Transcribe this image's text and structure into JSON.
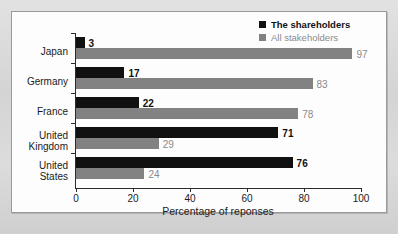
{
  "chart_data": {
    "type": "bar",
    "orientation": "horizontal",
    "title": "",
    "xlabel": "Percentage of reponses",
    "ylabel": "",
    "xlim": [
      0,
      100
    ],
    "xticks": [
      0,
      20,
      40,
      60,
      80,
      100
    ],
    "grid": false,
    "legend_position": "top-right",
    "categories": [
      "Japan",
      "Germany",
      "France",
      "United\nKingdom",
      "United\nStates"
    ],
    "series": [
      {
        "name": "The shareholders",
        "color": "#111111",
        "values": [
          3,
          17,
          22,
          71,
          76
        ]
      },
      {
        "name": "All stakeholders",
        "color": "#828282",
        "values": [
          97,
          83,
          78,
          29,
          24
        ]
      }
    ],
    "value_labels": {
      "shareholders": [
        "3",
        "17",
        "22",
        "71",
        "76"
      ],
      "stakeholders": [
        "97",
        "83",
        "78",
        "29",
        "24"
      ]
    }
  },
  "legend": {
    "entries": [
      {
        "label": "The shareholders",
        "swatch": "black"
      },
      {
        "label": "All stakeholders",
        "swatch": "gray"
      }
    ]
  },
  "axis": {
    "x_title": "Percentage of reponses",
    "x_tick_labels": [
      "0",
      "20",
      "40",
      "60",
      "80",
      "100"
    ]
  },
  "categories": {
    "c0": "Japan",
    "c1": "Germany",
    "c2": "France",
    "c3": "United\nKingdom",
    "c4": "United\nStates"
  }
}
